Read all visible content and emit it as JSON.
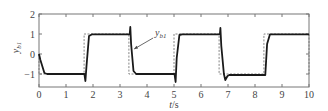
{
  "chart_data": {
    "type": "line",
    "title": "",
    "xlabel": "t/s",
    "ylabel": "y_b1",
    "xlim": [
      0,
      10
    ],
    "ylim": [
      -1.6,
      2
    ],
    "xticks": [
      0,
      1,
      2,
      3,
      4,
      5,
      6,
      7,
      8,
      9,
      10
    ],
    "yticks": [
      -1,
      0,
      1,
      2
    ],
    "grid": false,
    "annotations": [
      {
        "text": "y_b1",
        "arrow_to": [
          3.45,
          0.15
        ],
        "text_at": [
          4.3,
          0.9
        ]
      }
    ],
    "series": [
      {
        "name": "reference",
        "style": "dashed",
        "color": "#777777",
        "x": [
          0,
          0,
          1.67,
          1.67,
          3.33,
          3.33,
          5.0,
          5.0,
          6.67,
          6.67,
          8.33,
          8.33,
          10,
          10
        ],
        "y": [
          0,
          -1,
          -1,
          1,
          1,
          -1,
          -1,
          1,
          1,
          -1,
          -1,
          1,
          1,
          -1
        ]
      },
      {
        "name": "y_b1",
        "style": "solid",
        "color": "#1a1a1a",
        "x": [
          0,
          0.05,
          0.2,
          0.3,
          1.68,
          1.72,
          1.76,
          1.85,
          1.95,
          3.36,
          3.38,
          3.41,
          3.5,
          3.6,
          3.7,
          5.02,
          5.06,
          5.1,
          5.2,
          5.3,
          6.7,
          6.72,
          6.75,
          6.85,
          6.9,
          6.98,
          7.05,
          8.38,
          8.45,
          8.55,
          10
        ],
        "y": [
          0,
          -0.3,
          -0.95,
          -1,
          -1,
          -1.35,
          -0.6,
          0.9,
          0.98,
          0.98,
          1.35,
          0.5,
          -0.85,
          -1,
          -1,
          -1,
          -1.4,
          -0.2,
          0.95,
          0.98,
          0.98,
          1.3,
          0.4,
          -1.0,
          -1.3,
          -1.1,
          -1.05,
          -1.05,
          0.5,
          0.98,
          0.98
        ]
      }
    ]
  }
}
